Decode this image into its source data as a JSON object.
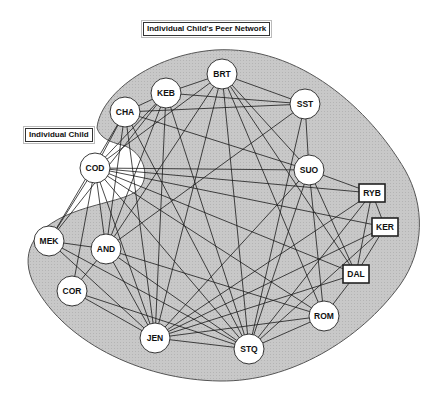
{
  "labels": {
    "network_title": "Individual Child's Peer Network",
    "individual_child": "Individual Child"
  },
  "colors": {
    "blob_fill": "#c6c6c6",
    "blob_stroke": "#555555",
    "edge": "#1a1a1a",
    "node_fill": "#ffffff",
    "node_stroke": "#222222"
  },
  "nodes": [
    {
      "id": "BRT",
      "label": "BRT",
      "shape": "circle",
      "x": 222,
      "y": 74
    },
    {
      "id": "KEB",
      "label": "KEB",
      "shape": "circle",
      "x": 166,
      "y": 93
    },
    {
      "id": "CHA",
      "label": "CHA",
      "shape": "circle",
      "x": 125,
      "y": 112
    },
    {
      "id": "SST",
      "label": "SST",
      "shape": "circle",
      "x": 305,
      "y": 104
    },
    {
      "id": "COD",
      "label": "COD",
      "shape": "circle",
      "x": 95,
      "y": 168
    },
    {
      "id": "SUO",
      "label": "SUO",
      "shape": "circle",
      "x": 309,
      "y": 170
    },
    {
      "id": "RYB",
      "label": "RYB",
      "shape": "box",
      "x": 372,
      "y": 193
    },
    {
      "id": "KER",
      "label": "KER",
      "shape": "box",
      "x": 385,
      "y": 227
    },
    {
      "id": "DAL",
      "label": "DAL",
      "shape": "box",
      "x": 356,
      "y": 274
    },
    {
      "id": "MEK",
      "label": "MEK",
      "shape": "circle",
      "x": 49,
      "y": 241
    },
    {
      "id": "AND",
      "label": "AND",
      "shape": "circle",
      "x": 106,
      "y": 249
    },
    {
      "id": "COR",
      "label": "COR",
      "shape": "circle",
      "x": 72,
      "y": 291
    },
    {
      "id": "JEN",
      "label": "JEN",
      "shape": "circle",
      "x": 155,
      "y": 338
    },
    {
      "id": "STQ",
      "label": "STQ",
      "shape": "circle",
      "x": 249,
      "y": 349
    },
    {
      "id": "ROM",
      "label": "ROM",
      "shape": "circle",
      "x": 324,
      "y": 316
    }
  ],
  "edges": [
    [
      "BRT",
      "KEB"
    ],
    [
      "BRT",
      "SST"
    ],
    [
      "BRT",
      "COD"
    ],
    [
      "BRT",
      "JEN"
    ],
    [
      "BRT",
      "STQ"
    ],
    [
      "BRT",
      "ROM"
    ],
    [
      "BRT",
      "SUO"
    ],
    [
      "BRT",
      "DAL"
    ],
    [
      "BRT",
      "AND"
    ],
    [
      "KEB",
      "CHA"
    ],
    [
      "KEB",
      "SST"
    ],
    [
      "KEB",
      "COD"
    ],
    [
      "KEB",
      "AND"
    ],
    [
      "KEB",
      "JEN"
    ],
    [
      "KEB",
      "STQ"
    ],
    [
      "KEB",
      "MEK"
    ],
    [
      "CHA",
      "SST"
    ],
    [
      "CHA",
      "COD"
    ],
    [
      "CHA",
      "SUO"
    ],
    [
      "CHA",
      "AND"
    ],
    [
      "CHA",
      "JEN"
    ],
    [
      "CHA",
      "STQ"
    ],
    [
      "CHA",
      "MEK"
    ],
    [
      "SST",
      "SUO"
    ],
    [
      "SST",
      "AND"
    ],
    [
      "SST",
      "STQ"
    ],
    [
      "COD",
      "SUO"
    ],
    [
      "COD",
      "RYB"
    ],
    [
      "COD",
      "KER"
    ],
    [
      "COD",
      "DAL"
    ],
    [
      "COD",
      "MEK"
    ],
    [
      "COD",
      "AND"
    ],
    [
      "COD",
      "COR"
    ],
    [
      "COD",
      "JEN"
    ],
    [
      "COD",
      "STQ"
    ],
    [
      "COD",
      "ROM"
    ],
    [
      "SUO",
      "RYB"
    ],
    [
      "SUO",
      "DAL"
    ],
    [
      "SUO",
      "ROM"
    ],
    [
      "SUO",
      "STQ"
    ],
    [
      "SUO",
      "JEN"
    ],
    [
      "RYB",
      "KER"
    ],
    [
      "RYB",
      "DAL"
    ],
    [
      "RYB",
      "STQ"
    ],
    [
      "RYB",
      "JEN"
    ],
    [
      "KER",
      "DAL"
    ],
    [
      "KER",
      "JEN"
    ],
    [
      "KER",
      "STQ"
    ],
    [
      "DAL",
      "ROM"
    ],
    [
      "DAL",
      "JEN"
    ],
    [
      "MEK",
      "AND"
    ],
    [
      "MEK",
      "JEN"
    ],
    [
      "MEK",
      "STQ"
    ],
    [
      "AND",
      "COR"
    ],
    [
      "AND",
      "JEN"
    ],
    [
      "AND",
      "STQ"
    ],
    [
      "AND",
      "ROM"
    ],
    [
      "COR",
      "JEN"
    ],
    [
      "COR",
      "STQ"
    ],
    [
      "JEN",
      "STQ"
    ],
    [
      "JEN",
      "ROM"
    ],
    [
      "STQ",
      "ROM"
    ]
  ]
}
